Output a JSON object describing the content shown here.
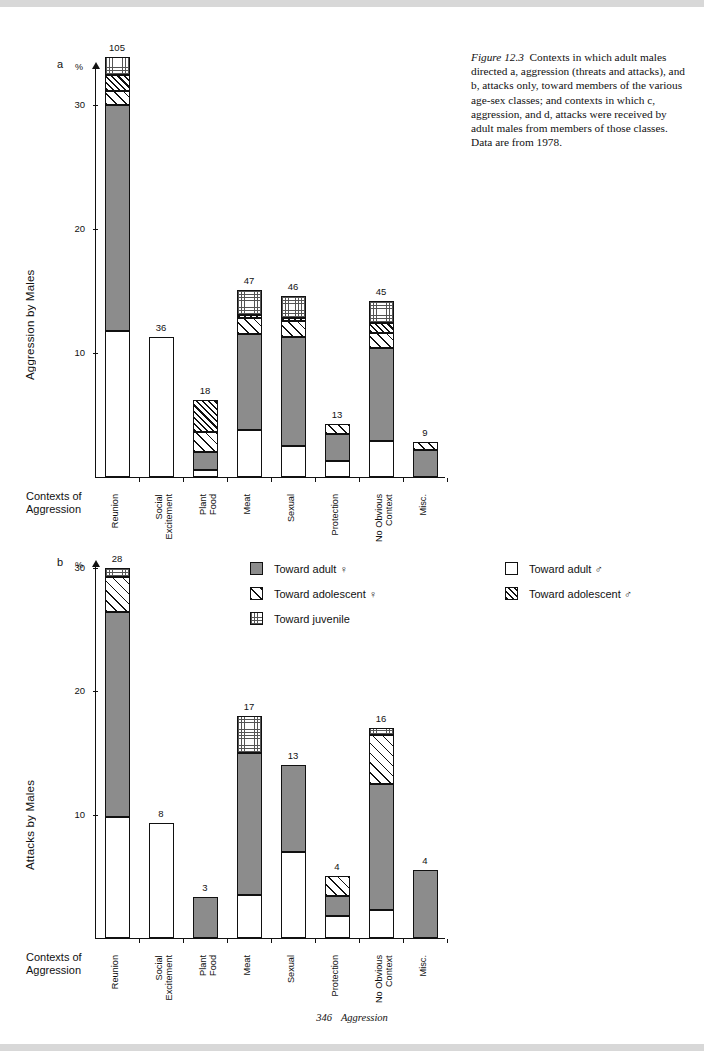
{
  "caption": {
    "figure_label": "Figure 12.3",
    "text": "Contexts in which adult males directed a, aggression (threats and attacks), and b, attacks only, toward members of the various age-sex classes; and contexts in which c, aggression, and d, attacks were received by adult males from members of those classes. Data are from 1978."
  },
  "footer": {
    "page": "346",
    "title": "Aggression"
  },
  "legend": {
    "items": [
      {
        "key": "adultF",
        "label": "Toward adult ♀",
        "pattern": "solid-gray"
      },
      {
        "key": "adolF",
        "label": "Toward adolescent ♀",
        "pattern": "wide-hatch"
      },
      {
        "key": "juv",
        "label": "Toward juvenile",
        "pattern": "dotted"
      },
      {
        "key": "adultM",
        "label": "Toward adult ♂",
        "pattern": "open-white"
      },
      {
        "key": "adolM",
        "label": "Toward adolescent ♂",
        "pattern": "dense-hatch"
      }
    ]
  },
  "chart_data": [
    {
      "panel": "a",
      "type": "bar",
      "stacked": true,
      "title": "",
      "ylabel": "Aggression by Males",
      "xlabel": "Contexts of Aggression",
      "yunit": "%",
      "ylim": [
        0,
        33
      ],
      "yticks": [
        10,
        20,
        30
      ],
      "grid": false,
      "categories": [
        "Reunion",
        "Social\nExcitement",
        "Plant\nFood",
        "Meat",
        "Sexual",
        "Protection",
        "No Obvious\nContext",
        "Misc."
      ],
      "totals": [
        105,
        36,
        18,
        47,
        46,
        13,
        45,
        9
      ],
      "series": [
        {
          "name": "Toward adult ♂",
          "key": "adultM",
          "values": [
            11.8,
            11.3,
            0.6,
            3.8,
            2.5,
            1.3,
            2.9,
            0.0
          ]
        },
        {
          "name": "Toward adult ♀",
          "key": "adultF",
          "values": [
            18.2,
            0.0,
            1.4,
            7.7,
            8.8,
            2.2,
            7.5,
            2.2
          ]
        },
        {
          "name": "Toward adolescent ♀",
          "key": "adolF",
          "values": [
            1.1,
            0.0,
            1.6,
            1.3,
            1.3,
            0.8,
            1.2,
            0.6
          ]
        },
        {
          "name": "Toward adolescent ♂",
          "key": "adolM",
          "values": [
            1.3,
            0.0,
            2.6,
            0.3,
            0.2,
            0.0,
            0.8,
            0.0
          ]
        },
        {
          "name": "Toward juvenile",
          "key": "juv",
          "values": [
            1.5,
            0.0,
            0.0,
            2.0,
            1.8,
            0.0,
            1.8,
            0.0
          ]
        }
      ]
    },
    {
      "panel": "b",
      "type": "bar",
      "stacked": true,
      "title": "",
      "ylabel": "Attacks by Males",
      "xlabel": "Contexts of Aggression",
      "yunit": "%",
      "ylim": [
        0,
        32
      ],
      "yticks": [
        10,
        20,
        30
      ],
      "grid": false,
      "categories": [
        "Reunion",
        "Social\nExcitement",
        "Plant\nFood",
        "Meat",
        "Sexual",
        "Protection",
        "No Obvious\nContext",
        "Misc."
      ],
      "totals": [
        28,
        8,
        3,
        17,
        13,
        4,
        16,
        4
      ],
      "series": [
        {
          "name": "Toward adult ♂",
          "key": "adultM",
          "values": [
            9.8,
            9.3,
            0.0,
            3.5,
            7.0,
            1.8,
            2.3,
            0.0
          ]
        },
        {
          "name": "Toward adult ♀",
          "key": "adultF",
          "values": [
            16.6,
            0.0,
            3.3,
            11.5,
            7.0,
            1.6,
            10.2,
            5.5
          ]
        },
        {
          "name": "Toward adolescent ♀",
          "key": "adolF",
          "values": [
            2.8,
            0.0,
            0.0,
            0.0,
            0.0,
            1.6,
            3.9,
            0.0
          ]
        },
        {
          "name": "Toward adolescent ♂",
          "key": "adolM",
          "values": [
            0.0,
            0.0,
            0.0,
            0.0,
            0.0,
            0.0,
            0.0,
            0.0
          ]
        },
        {
          "name": "Toward juvenile",
          "key": "juv",
          "values": [
            0.8,
            0.0,
            0.0,
            3.0,
            0.0,
            0.0,
            0.6,
            0.0
          ]
        }
      ]
    }
  ]
}
